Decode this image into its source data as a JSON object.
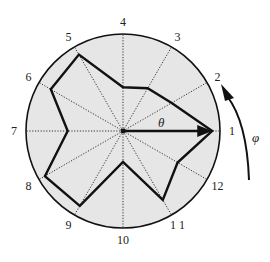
{
  "diagram": {
    "type": "polar-star-diagram",
    "center": [
      123,
      131
    ],
    "radius": 97,
    "colors": {
      "disc_fill": "#e6e6e6",
      "outline": "#111111",
      "spoke": "#333333",
      "polygon": "#111111",
      "background": "#ffffff"
    },
    "spokes": [
      {
        "label": "1",
        "value": 0.92
      },
      {
        "label": "2",
        "value": 0.58
      },
      {
        "label": "3",
        "value": 0.51
      },
      {
        "label": "4",
        "value": 0.45
      },
      {
        "label": "5",
        "value": 0.91
      },
      {
        "label": "6",
        "value": 0.86
      },
      {
        "label": "7",
        "value": 0.57
      },
      {
        "label": "8",
        "value": 0.93
      },
      {
        "label": "9",
        "value": 0.89
      },
      {
        "label": "10",
        "value": 0.32
      },
      {
        "label": "1 1",
        "value": 0.82
      },
      {
        "label": "12",
        "value": 0.65
      }
    ],
    "angle_symbol": "θ",
    "rotation_symbol": "φ",
    "rotation_direction": "counterclockwise"
  }
}
